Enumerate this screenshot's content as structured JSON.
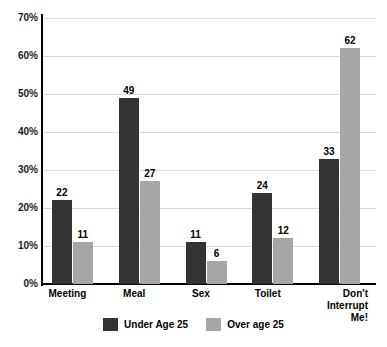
{
  "chart_data": {
    "type": "bar",
    "title": "",
    "subtitle": "",
    "xlabel": "",
    "ylabel": "",
    "categories": [
      "Meeting",
      "Meal",
      "Sex",
      "Toilet",
      "Don't Interrupt\nMe!"
    ],
    "series": [
      {
        "name": "Under Age 25",
        "color": "#333333",
        "values": [
          22,
          49,
          11,
          24,
          33
        ]
      },
      {
        "name": "Over age 25",
        "color": "#a6a6a6",
        "values": [
          11,
          27,
          6,
          12,
          62
        ]
      }
    ],
    "ylim": [
      0,
      70
    ],
    "ytick_values": [
      0,
      10,
      20,
      30,
      40,
      50,
      60,
      70
    ],
    "ytick_labels": [
      "0%",
      "10%",
      "20%",
      "30%",
      "40%",
      "50%",
      "60%",
      "70%"
    ],
    "value_labels_shown": true,
    "grid": "horizontal",
    "legend_position": "bottom",
    "background": "#ffffff",
    "axis_color": "#000000",
    "gridline_color": "#d9d9d9"
  }
}
